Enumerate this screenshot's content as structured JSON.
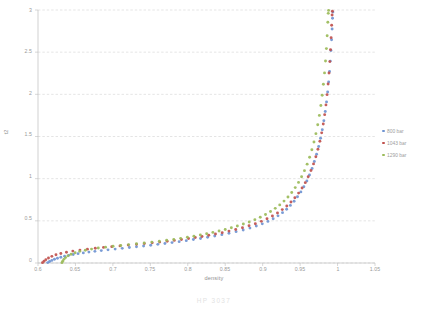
{
  "chart_data": {
    "type": "scatter",
    "title": "",
    "xlabel": "density",
    "ylabel": "t2",
    "xlim": [
      0.6,
      1.05
    ],
    "ylim": [
      0,
      3
    ],
    "xticks": [
      "0.6",
      "0.65",
      "0.7",
      "0.75",
      "0.8",
      "0.85",
      "0.9",
      "0.95",
      "1",
      "1.05"
    ],
    "yticks": [
      "0",
      "0.5",
      "1",
      "1.5",
      "2",
      "2.5",
      "3"
    ],
    "grid": "horizontal",
    "legend_position": "right",
    "series": [
      {
        "name": "800 bar",
        "color": "#6f94d2",
        "points": [
          [
            0.613,
            0.005
          ],
          [
            0.6155,
            0.018
          ],
          [
            0.6185,
            0.031
          ],
          [
            0.622,
            0.044
          ],
          [
            0.626,
            0.057
          ],
          [
            0.6305,
            0.069
          ],
          [
            0.6355,
            0.08
          ],
          [
            0.641,
            0.091
          ],
          [
            0.647,
            0.101
          ],
          [
            0.6535,
            0.111
          ],
          [
            0.6605,
            0.12
          ],
          [
            0.668,
            0.129
          ],
          [
            0.676,
            0.138
          ],
          [
            0.6845,
            0.147
          ],
          [
            0.6935,
            0.156
          ],
          [
            0.703,
            0.165
          ],
          [
            0.7125,
            0.174
          ],
          [
            0.722,
            0.183
          ],
          [
            0.7315,
            0.192
          ],
          [
            0.741,
            0.201
          ],
          [
            0.7505,
            0.211
          ],
          [
            0.76,
            0.221
          ],
          [
            0.7695,
            0.231
          ],
          [
            0.779,
            0.242
          ],
          [
            0.7885,
            0.253
          ],
          [
            0.798,
            0.265
          ],
          [
            0.8075,
            0.278
          ],
          [
            0.817,
            0.291
          ],
          [
            0.8265,
            0.305
          ],
          [
            0.836,
            0.32
          ],
          [
            0.8455,
            0.336
          ],
          [
            0.855,
            0.353
          ],
          [
            0.8645,
            0.372
          ],
          [
            0.874,
            0.392
          ],
          [
            0.883,
            0.414
          ],
          [
            0.8915,
            0.438
          ],
          [
            0.8995,
            0.464
          ],
          [
            0.907,
            0.493
          ],
          [
            0.914,
            0.525
          ],
          [
            0.9205,
            0.559
          ],
          [
            0.9265,
            0.597
          ],
          [
            0.932,
            0.638
          ],
          [
            0.937,
            0.683
          ],
          [
            0.942,
            0.732
          ],
          [
            0.9465,
            0.785
          ],
          [
            0.951,
            0.843
          ],
          [
            0.955,
            0.905
          ],
          [
            0.959,
            0.972
          ],
          [
            0.9625,
            1.044
          ],
          [
            0.966,
            1.121
          ],
          [
            0.969,
            1.203
          ],
          [
            0.972,
            1.29
          ],
          [
            0.9748,
            1.382
          ],
          [
            0.9773,
            1.479
          ],
          [
            0.9796,
            1.58
          ],
          [
            0.9817,
            1.686
          ],
          [
            0.9836,
            1.796
          ],
          [
            0.9853,
            1.91
          ],
          [
            0.9868,
            2.027
          ],
          [
            0.9881,
            2.147
          ],
          [
            0.9893,
            2.27
          ],
          [
            0.9903,
            2.394
          ],
          [
            0.9912,
            2.52
          ],
          [
            0.992,
            2.647
          ],
          [
            0.9927,
            2.775
          ],
          [
            0.9933,
            2.903
          ],
          [
            0.9938,
            2.975
          ]
        ]
      },
      {
        "name": "1043 bar",
        "color": "#c0504d",
        "points": [
          [
            0.606,
            0.004
          ],
          [
            0.608,
            0.021
          ],
          [
            0.6105,
            0.04
          ],
          [
            0.614,
            0.06
          ],
          [
            0.6185,
            0.079
          ],
          [
            0.624,
            0.097
          ],
          [
            0.6305,
            0.113
          ],
          [
            0.638,
            0.128
          ],
          [
            0.6465,
            0.141
          ],
          [
            0.656,
            0.153
          ],
          [
            0.666,
            0.164
          ],
          [
            0.6765,
            0.175
          ],
          [
            0.6875,
            0.185
          ],
          [
            0.6985,
            0.194
          ],
          [
            0.7095,
            0.203
          ],
          [
            0.7205,
            0.212
          ],
          [
            0.7315,
            0.221
          ],
          [
            0.742,
            0.23
          ],
          [
            0.7525,
            0.239
          ],
          [
            0.7625,
            0.248
          ],
          [
            0.7725,
            0.258
          ],
          [
            0.782,
            0.268
          ],
          [
            0.7915,
            0.279
          ],
          [
            0.801,
            0.29
          ],
          [
            0.81,
            0.302
          ],
          [
            0.819,
            0.315
          ],
          [
            0.828,
            0.329
          ],
          [
            0.837,
            0.344
          ],
          [
            0.846,
            0.36
          ],
          [
            0.855,
            0.378
          ],
          [
            0.864,
            0.397
          ],
          [
            0.873,
            0.418
          ],
          [
            0.8818,
            0.441
          ],
          [
            0.8902,
            0.466
          ],
          [
            0.8982,
            0.494
          ],
          [
            0.9058,
            0.524
          ],
          [
            0.913,
            0.557
          ],
          [
            0.9198,
            0.593
          ],
          [
            0.9262,
            0.633
          ],
          [
            0.9322,
            0.676
          ],
          [
            0.9378,
            0.723
          ],
          [
            0.943,
            0.774
          ],
          [
            0.948,
            0.829
          ],
          [
            0.9526,
            0.889
          ],
          [
            0.9569,
            0.953
          ],
          [
            0.9608,
            1.022
          ],
          [
            0.9645,
            1.096
          ],
          [
            0.9679,
            1.175
          ],
          [
            0.971,
            1.259
          ],
          [
            0.9738,
            1.348
          ],
          [
            0.9764,
            1.443
          ],
          [
            0.9788,
            1.543
          ],
          [
            0.9809,
            1.648
          ],
          [
            0.9828,
            1.759
          ],
          [
            0.9845,
            1.875
          ],
          [
            0.986,
            1.996
          ],
          [
            0.9874,
            2.122
          ],
          [
            0.9886,
            2.253
          ],
          [
            0.9897,
            2.388
          ],
          [
            0.9906,
            2.528
          ],
          [
            0.9914,
            2.672
          ],
          [
            0.9921,
            2.82
          ],
          [
            0.9927,
            2.94
          ],
          [
            0.9931,
            2.985
          ]
        ]
      },
      {
        "name": "1290 bar",
        "color": "#9bbb59",
        "points": [
          [
            0.632,
            0.004
          ],
          [
            0.633,
            0.022
          ],
          [
            0.6345,
            0.043
          ],
          [
            0.6368,
            0.064
          ],
          [
            0.64,
            0.085
          ],
          [
            0.6442,
            0.104
          ],
          [
            0.6495,
            0.122
          ],
          [
            0.6558,
            0.138
          ],
          [
            0.6632,
            0.152
          ],
          [
            0.6715,
            0.165
          ],
          [
            0.6805,
            0.177
          ],
          [
            0.6902,
            0.188
          ],
          [
            0.7002,
            0.198
          ],
          [
            0.7105,
            0.208
          ],
          [
            0.721,
            0.218
          ],
          [
            0.7315,
            0.228
          ],
          [
            0.7418,
            0.238
          ],
          [
            0.752,
            0.248
          ],
          [
            0.762,
            0.258
          ],
          [
            0.7718,
            0.269
          ],
          [
            0.7813,
            0.28
          ],
          [
            0.7905,
            0.292
          ],
          [
            0.7995,
            0.305
          ],
          [
            0.8082,
            0.318
          ],
          [
            0.8168,
            0.332
          ],
          [
            0.8252,
            0.347
          ],
          [
            0.8335,
            0.363
          ],
          [
            0.8418,
            0.38
          ],
          [
            0.85,
            0.398
          ],
          [
            0.8582,
            0.418
          ],
          [
            0.8662,
            0.439
          ],
          [
            0.8742,
            0.462
          ],
          [
            0.882,
            0.487
          ],
          [
            0.8896,
            0.514
          ],
          [
            0.8968,
            0.543
          ],
          [
            0.9038,
            0.575
          ],
          [
            0.9105,
            0.61
          ],
          [
            0.9168,
            0.648
          ],
          [
            0.9228,
            0.689
          ],
          [
            0.9285,
            0.734
          ],
          [
            0.9338,
            0.783
          ],
          [
            0.9388,
            0.836
          ],
          [
            0.9435,
            0.894
          ],
          [
            0.9479,
            0.956
          ],
          [
            0.952,
            1.023
          ],
          [
            0.9558,
            1.095
          ],
          [
            0.9594,
            1.172
          ],
          [
            0.9627,
            1.254
          ],
          [
            0.9657,
            1.342
          ],
          [
            0.9685,
            1.435
          ],
          [
            0.9711,
            1.534
          ],
          [
            0.9735,
            1.639
          ],
          [
            0.9757,
            1.75
          ],
          [
            0.9777,
            1.867
          ],
          [
            0.9795,
            1.99
          ],
          [
            0.9811,
            2.119
          ],
          [
            0.9826,
            2.254
          ],
          [
            0.9839,
            2.395
          ],
          [
            0.9851,
            2.542
          ],
          [
            0.9861,
            2.695
          ],
          [
            0.987,
            2.854
          ],
          [
            0.9876,
            2.96
          ],
          [
            0.988,
            2.995
          ]
        ]
      }
    ]
  },
  "caption": "HP 3037"
}
